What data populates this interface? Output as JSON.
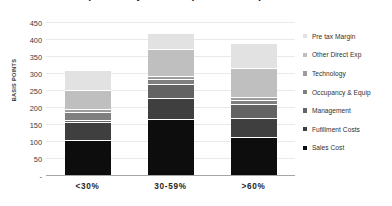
{
  "chart_data": {
    "type": "bar",
    "subtype": "stacked-column",
    "title": "Cost Comparison by Channel (Basis Points)",
    "xlabel": "",
    "ylabel": "BASIS POINTS",
    "ylim": [
      0,
      450
    ],
    "ytick_values": [
      0,
      50,
      100,
      150,
      200,
      250,
      300,
      350,
      400,
      450
    ],
    "ytick_labels": [
      "-",
      "50",
      "100",
      "150",
      "200",
      "250",
      "300",
      "350",
      "400",
      "450"
    ],
    "grid": true,
    "legend_position": "right",
    "categories": [
      "<30%",
      "30-59%",
      ">60%"
    ],
    "series": [
      {
        "name": "Sales Cost",
        "color": "#0d0d0d",
        "values": [
          100,
          163,
          108
        ]
      },
      {
        "name": "Fufillment Costs",
        "color": "#3f3f3f",
        "values": [
          52,
          62,
          58
        ]
      },
      {
        "name": "Management",
        "color": "#636363",
        "values": [
          8,
          40,
          40
        ]
      },
      {
        "name": "Occupancy & Equip",
        "color": "#7f7f7f",
        "values": [
          22,
          14,
          12
        ]
      },
      {
        "name": "Technology",
        "color": "#9c9c9c",
        "values": [
          8,
          8,
          10
        ]
      },
      {
        "name": "Other Direct Exp",
        "color": "#bfbfbf",
        "values": [
          56,
          80,
          85
        ]
      },
      {
        "name": "Pre tax Margin",
        "color": "#e2e2e2",
        "values": [
          59,
          48,
          72
        ]
      }
    ],
    "totals": [
      305,
      415,
      385
    ]
  },
  "legend": {
    "items": [
      {
        "label": "Pre tax Margin",
        "color": "#e2e2e2"
      },
      {
        "label": "Other Direct Exp",
        "color": "#bfbfbf"
      },
      {
        "label": "Technology",
        "color": "#9c9c9c"
      },
      {
        "label": "Occupancy & Equip",
        "color": "#7f7f7f"
      },
      {
        "label": "Management",
        "color": "#636363"
      },
      {
        "label": "Fufillment Costs",
        "color": "#3f3f3f"
      },
      {
        "label": "Sales Cost",
        "color": "#0d0d0d"
      }
    ]
  }
}
